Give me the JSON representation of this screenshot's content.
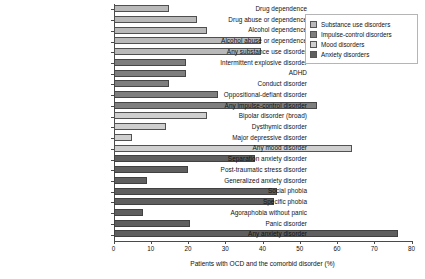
{
  "chart_data": {
    "type": "bar",
    "orientation": "horizontal",
    "title": "",
    "xlabel": "Patients with OCD and the comorbid disorder (%)",
    "ylabel": "",
    "xlim": [
      0,
      80
    ],
    "xticks": [
      0,
      10,
      20,
      30,
      40,
      50,
      60,
      70,
      80
    ],
    "grid": false,
    "legend_position": "top-right",
    "categories": [
      "Drug dependence",
      "Drug abuse or dependence",
      "Alcohol dependence",
      "Alcohol abuse or dependence",
      "Any substance use disorder",
      "Intermittent explosive disorder",
      "ADHD",
      "Conduct disorder",
      "Oppositional-defiant disorder",
      "Any impulse-control disorder",
      "Bipolar disorder (broad)",
      "Dysthymic disorder",
      "Major depressive disorder",
      "Any mood disorder",
      "Separation anxiety disorder",
      "Post-traumatic stress disorder",
      "Generalized anxiety disorder",
      "Social phobia",
      "Specific phobia",
      "Agoraphobia without panic",
      "Panic disorder",
      "Any anxiety disorder"
    ],
    "values": [
      15,
      22.5,
      25,
      39.5,
      39.5,
      19.5,
      19.5,
      15,
      28,
      54.5,
      25,
      14,
      5,
      64,
      38,
      20,
      9,
      44,
      43,
      8,
      20.5,
      76.5
    ],
    "groups": [
      "substance",
      "substance",
      "substance",
      "substance",
      "substance",
      "impulse",
      "impulse",
      "impulse",
      "impulse",
      "impulse",
      "mood",
      "mood",
      "mood",
      "mood",
      "anxiety",
      "anxiety",
      "anxiety",
      "anxiety",
      "anxiety",
      "anxiety",
      "anxiety",
      "anxiety"
    ]
  },
  "legend": {
    "items": [
      {
        "label": "Substance use disorders",
        "key": "substance",
        "color": "#b9b9b9"
      },
      {
        "label": "Impulse-control disorders",
        "key": "impulse",
        "color": "#7e7e7e"
      },
      {
        "label": "Mood disorders",
        "key": "mood",
        "color": "#cfcfcf"
      },
      {
        "label": "Anxiety disorders",
        "key": "anxiety",
        "color": "#5f5f5f"
      }
    ]
  }
}
